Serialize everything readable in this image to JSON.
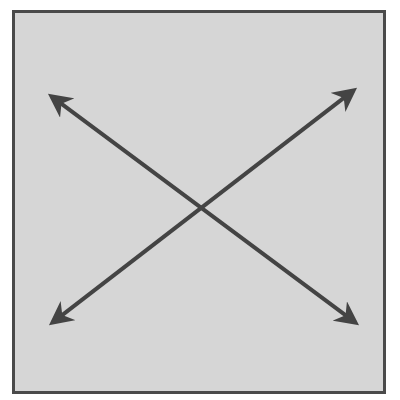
{
  "diagram": {
    "colors": {
      "page_background": "#ffffff",
      "box_fill": "#d6d6d6",
      "box_border": "#4a4a4a",
      "arrow": "#444444"
    },
    "box": {
      "x": 12,
      "y": 10,
      "width": 373,
      "height": 383,
      "border_width": 3
    },
    "arrows": [
      {
        "name": "arrow-top-left-to-bottom-right",
        "start": [
          47,
          93
        ],
        "end": [
          360,
          326
        ],
        "double_headed": true
      },
      {
        "name": "arrow-bottom-left-to-top-right",
        "start": [
          48,
          326
        ],
        "end": [
          358,
          87
        ],
        "double_headed": true
      }
    ]
  }
}
